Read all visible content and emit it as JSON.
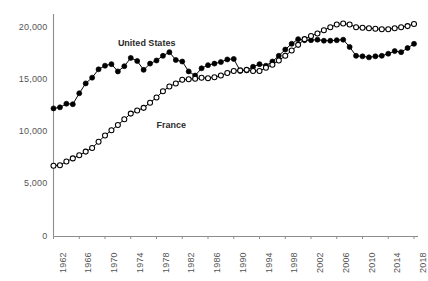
{
  "chart_data": {
    "type": "line",
    "title": "",
    "subtitle": "",
    "xlabel": "",
    "ylabel": "",
    "xlim": [
      1962,
      2018
    ],
    "ylim": [
      0,
      21500
    ],
    "grid": false,
    "legend_position": "inline-annotations",
    "y_ticks": [
      0,
      5000,
      10000,
      15000,
      20000
    ],
    "y_tick_labels": [
      "0",
      "5,000",
      "10,000",
      "15,000",
      "20,000"
    ],
    "x_ticks": [
      1962,
      1966,
      1970,
      1974,
      1978,
      1982,
      1986,
      1990,
      1994,
      1998,
      2002,
      2006,
      2010,
      2014,
      2018
    ],
    "x_tick_labels": [
      "1962",
      "1966",
      "1970",
      "1974",
      "1978",
      "1982",
      "1986",
      "1990",
      "1994",
      "1998",
      "2002",
      "2006",
      "2010",
      "2014",
      "2018"
    ],
    "x": [
      1962,
      1963,
      1964,
      1965,
      1966,
      1967,
      1968,
      1969,
      1970,
      1971,
      1972,
      1973,
      1974,
      1975,
      1976,
      1977,
      1978,
      1979,
      1980,
      1981,
      1982,
      1983,
      1984,
      1985,
      1986,
      1987,
      1988,
      1989,
      1990,
      1991,
      1992,
      1993,
      1994,
      1995,
      1996,
      1997,
      1998,
      1999,
      2000,
      2001,
      2002,
      2003,
      2004,
      2005,
      2006,
      2007,
      2008,
      2009,
      2010,
      2011,
      2012,
      2013,
      2014,
      2015,
      2016,
      2017,
      2018
    ],
    "series": [
      {
        "name": "United States",
        "marker": "filled-circle",
        "color": "#000000",
        "label_x": 1972,
        "label_y": 18450,
        "values": [
          12300,
          12400,
          12750,
          12700,
          13750,
          14700,
          15250,
          16050,
          16400,
          16550,
          15850,
          16350,
          17150,
          16850,
          16000,
          16600,
          16900,
          17350,
          17700,
          16950,
          16800,
          15850,
          15450,
          16150,
          16450,
          16600,
          16750,
          17000,
          17050,
          15900,
          15950,
          16300,
          16550,
          16400,
          16800,
          17350,
          17950,
          18500,
          18950,
          18850,
          18850,
          18900,
          18800,
          18800,
          18850,
          18900,
          18200,
          17350,
          17300,
          17200,
          17300,
          17350,
          17550,
          17800,
          17700,
          18100,
          18500
        ]
      },
      {
        "name": "France",
        "marker": "open-circle",
        "color": "#000000",
        "label_x": 1978,
        "label_y": 10600,
        "values": [
          6800,
          6850,
          7200,
          7500,
          7800,
          8150,
          8500,
          9100,
          9700,
          10200,
          10700,
          11250,
          11800,
          12100,
          12350,
          12850,
          13350,
          13950,
          14400,
          14700,
          15050,
          15100,
          15150,
          15250,
          15200,
          15300,
          15450,
          15700,
          15900,
          15950,
          16000,
          15900,
          15900,
          16200,
          16500,
          16900,
          17350,
          17850,
          18400,
          18950,
          19250,
          19500,
          19800,
          20100,
          20350,
          20450,
          20350,
          20100,
          20050,
          20000,
          19950,
          19900,
          19900,
          20000,
          20100,
          20200,
          20400
        ]
      }
    ]
  }
}
